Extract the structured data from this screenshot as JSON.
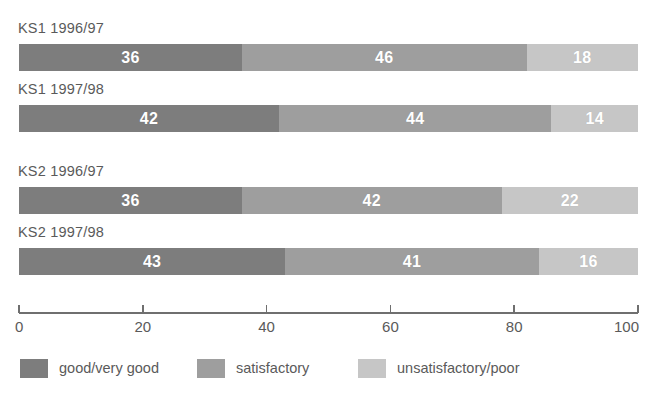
{
  "chart_data": {
    "type": "bar",
    "orientation": "horizontal",
    "stacked": true,
    "stacked_percent": true,
    "title": "",
    "subtitle": "",
    "xlabel": "",
    "ylabel": "",
    "xlim": [
      0,
      100
    ],
    "xticks": [
      0,
      20,
      40,
      60,
      80,
      100
    ],
    "xtick_labels": [
      "0",
      "20",
      "40",
      "60",
      "80",
      "100"
    ],
    "grid": false,
    "legend_position": "bottom",
    "categories": [
      "KS1 1996/97",
      "KS1 1997/98",
      "KS2 1996/97",
      "KS2 1997/98"
    ],
    "series": [
      {
        "name": "good/very good",
        "color": "#7d7d7d",
        "values": [
          36,
          42,
          36,
          43
        ]
      },
      {
        "name": "satisfactory",
        "color": "#9e9e9e",
        "values": [
          46,
          44,
          42,
          41
        ]
      },
      {
        "name": "unsatisfactory/poor",
        "color": "#c6c6c6",
        "values": [
          18,
          14,
          22,
          16
        ]
      }
    ]
  },
  "groups": [
    {
      "label": "KS1 1996/97",
      "label_top": 20,
      "bar_top": 44,
      "segments": [
        {
          "value": "36",
          "pct": 36,
          "series": "good/very good"
        },
        {
          "value": "46",
          "pct": 46,
          "series": "satisfactory"
        },
        {
          "value": "18",
          "pct": 18,
          "series": "unsatisfactory/poor"
        }
      ]
    },
    {
      "label": "KS1 1997/98",
      "label_top": 81,
      "bar_top": 105,
      "segments": [
        {
          "value": "42",
          "pct": 42,
          "series": "good/very good"
        },
        {
          "value": "44",
          "pct": 44,
          "series": "satisfactory"
        },
        {
          "value": "14",
          "pct": 14,
          "series": "unsatisfactory/poor"
        }
      ]
    },
    {
      "label": "KS2 1996/97",
      "label_top": 163,
      "bar_top": 187,
      "segments": [
        {
          "value": "36",
          "pct": 36,
          "series": "good/very good"
        },
        {
          "value": "42",
          "pct": 42,
          "series": "satisfactory"
        },
        {
          "value": "22",
          "pct": 22,
          "series": "unsatisfactory/poor"
        }
      ]
    },
    {
      "label": "KS2 1997/98",
      "label_top": 224,
      "bar_top": 248,
      "segments": [
        {
          "value": "43",
          "pct": 43,
          "series": "good/very good"
        },
        {
          "value": "41",
          "pct": 41,
          "series": "satisfactory"
        },
        {
          "value": "16",
          "pct": 16,
          "series": "unsatisfactory/poor"
        }
      ]
    }
  ],
  "axis": {
    "ticks": [
      {
        "label": "0",
        "pct": 0
      },
      {
        "label": "20",
        "pct": 20
      },
      {
        "label": "40",
        "pct": 40
      },
      {
        "label": "60",
        "pct": 60
      },
      {
        "label": "80",
        "pct": 80
      },
      {
        "label": "100",
        "pct": 100
      }
    ],
    "line_color": "#6f6f6f"
  },
  "legend": {
    "items": [
      {
        "label": "good/very good",
        "color": "#7d7d7d",
        "left": 20
      },
      {
        "label": "satisfactory",
        "color": "#9e9e9e",
        "left": 197
      },
      {
        "label": "unsatisfactory/poor",
        "color": "#c6c6c6",
        "left": 358
      }
    ]
  },
  "colors": {
    "series_dark": "#7d7d7d",
    "series_mid": "#9e9e9e",
    "series_light": "#c6c6c6",
    "text": "#5a5a5a",
    "value_text": "#ffffff",
    "background": "#ffffff",
    "axis": "#6f6f6f"
  }
}
